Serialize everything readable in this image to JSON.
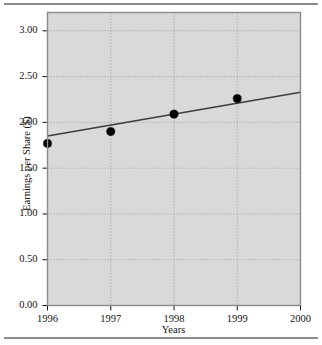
{
  "chart_data": {
    "type": "scatter",
    "title": "",
    "xlabel": "Years",
    "ylabel": "Earnings per Share ($)",
    "x": [
      1996,
      1997,
      1998,
      1999
    ],
    "values": [
      1.77,
      1.9,
      2.09,
      2.26
    ],
    "categories": [
      "1996",
      "1997",
      "1998",
      "1999"
    ],
    "series": [
      {
        "name": "Earnings per Share",
        "type": "scatter",
        "x": [
          1996,
          1997,
          1998,
          1999
        ],
        "values": [
          1.77,
          1.9,
          2.09,
          2.26
        ]
      },
      {
        "name": "Trend line",
        "type": "line",
        "x": [
          1996,
          2000
        ],
        "values": [
          1.85,
          2.33
        ]
      }
    ],
    "xlim": [
      1996,
      2000
    ],
    "ylim": [
      0.0,
      3.2
    ],
    "xticks": [
      1996,
      1997,
      1998,
      1999,
      2000
    ],
    "xtick_labels": [
      "1996",
      "1997",
      "1998",
      "1999",
      "2000"
    ],
    "yticks": [
      0.0,
      0.5,
      1.0,
      1.5,
      2.0,
      2.5,
      3.0
    ],
    "ytick_labels": [
      "0.00",
      "0.50",
      "1.00",
      "1.50",
      "2.00",
      "2.50",
      "3.00"
    ],
    "grid": true,
    "grid_style": "dotted",
    "legend": "none",
    "marker": "filled-circle",
    "plot_background": "#d9d9d9",
    "grid_color": "#9a9a9a",
    "marker_color": "#000000",
    "line_color": "#3c3c3c",
    "axis_color": "#7a7a7a",
    "text_color": "#141414"
  },
  "figure": {
    "top_rule": "",
    "bottom_rule": ""
  }
}
